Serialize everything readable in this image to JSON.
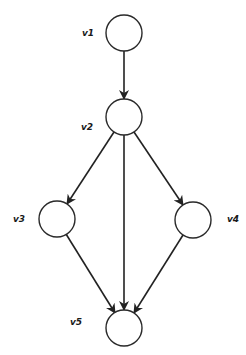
{
  "diagram": {
    "type": "directed-graph",
    "colors": {
      "stroke": "#222222",
      "node_fill": "#ffffff",
      "label": "#1a1a1a"
    },
    "nodes": [
      {
        "id": "v1",
        "label": "v1",
        "cx": 124,
        "cy": 33,
        "r": 18,
        "label_x": 82,
        "label_y": 36
      },
      {
        "id": "v2",
        "label": "v2",
        "cx": 124,
        "cy": 117,
        "r": 18,
        "label_x": 81,
        "label_y": 130
      },
      {
        "id": "v3",
        "label": "v3",
        "cx": 57,
        "cy": 219,
        "r": 18,
        "label_x": 13,
        "label_y": 222
      },
      {
        "id": "v4",
        "label": "v4",
        "cx": 193,
        "cy": 220,
        "r": 18,
        "label_x": 227,
        "label_y": 222
      },
      {
        "id": "v5",
        "label": "v5",
        "cx": 124,
        "cy": 328,
        "r": 18,
        "label_x": 70,
        "label_y": 325
      }
    ],
    "edges": [
      {
        "from": "v1",
        "to": "v2",
        "x1": 124,
        "y1": 51,
        "x2": 124,
        "y2": 99
      },
      {
        "from": "v2",
        "to": "v3",
        "x1": 114,
        "y1": 132,
        "x2": 67,
        "y2": 204
      },
      {
        "from": "v2",
        "to": "v5",
        "x1": 124,
        "y1": 135,
        "x2": 124,
        "y2": 310
      },
      {
        "from": "v2",
        "to": "v4",
        "x1": 134,
        "y1": 132,
        "x2": 183,
        "y2": 205
      },
      {
        "from": "v3",
        "to": "v5",
        "x1": 66,
        "y1": 234,
        "x2": 115,
        "y2": 313
      },
      {
        "from": "v4",
        "to": "v5",
        "x1": 183,
        "y1": 235,
        "x2": 134,
        "y2": 313
      }
    ]
  }
}
